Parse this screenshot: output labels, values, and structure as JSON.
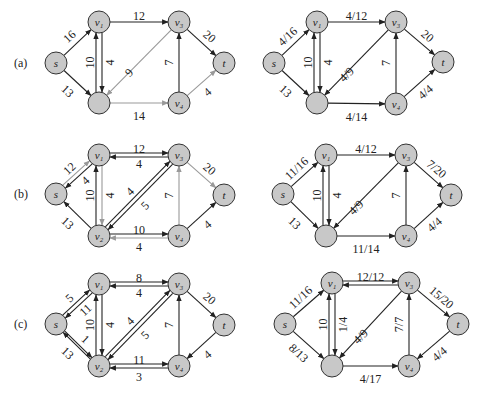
{
  "colors": {
    "node_fill": "#c8c8c8",
    "node_stroke": "#333333",
    "edge_dark": "#222222",
    "edge_gray": "#999999"
  },
  "node_radius": 11,
  "panels": [
    {
      "id": "a-left",
      "row_label": "(a)",
      "row_label_pos": [
        14,
        67
      ],
      "nodes": {
        "s": [
          56,
          63
        ],
        "v1": [
          99,
          22
        ],
        "v2": [
          99,
          103
        ],
        "v3": [
          179,
          22
        ],
        "v4": [
          179,
          103
        ],
        "t": [
          224,
          63
        ]
      },
      "node_labels": {
        "s": "s",
        "v1": "v₁",
        "v2": "",
        "v3": "v₃",
        "v4": "v₄",
        "t": "t"
      },
      "edges": [
        {
          "from": "s",
          "to": "v1",
          "label": "16",
          "color": "dark",
          "lx": -8,
          "ly": -6,
          "rot": -43
        },
        {
          "from": "s",
          "to": "v2",
          "label": "13",
          "color": "dark",
          "lx": -10,
          "ly": 8,
          "rot": 43
        },
        {
          "from": "v1",
          "to": "v2",
          "label": "10",
          "color": "dark",
          "off": -3,
          "lx": -9,
          "ly": 0,
          "rot": -90
        },
        {
          "from": "v2",
          "to": "v1",
          "label": "4",
          "color": "dark",
          "off": -3,
          "lx": 11,
          "ly": 0,
          "rot": -90
        },
        {
          "from": "v1",
          "to": "v3",
          "label": "12",
          "color": "dark",
          "lx": 0,
          "ly": -6,
          "rot": 0
        },
        {
          "from": "v3",
          "to": "v2",
          "label": "9",
          "color": "gray",
          "lx": -10,
          "ly": 10,
          "rot": -45
        },
        {
          "from": "v2",
          "to": "v4",
          "label": "14",
          "color": "gray",
          "lx": 0,
          "ly": 13,
          "rot": 0
        },
        {
          "from": "v4",
          "to": "v3",
          "label": "7",
          "color": "dark",
          "lx": -10,
          "ly": 0,
          "rot": -90
        },
        {
          "from": "v3",
          "to": "t",
          "label": "20",
          "color": "dark",
          "lx": 8,
          "ly": -6,
          "rot": 40
        },
        {
          "from": "v4",
          "to": "t",
          "label": "4",
          "color": "gray",
          "lx": 6,
          "ly": 9,
          "rot": -40
        }
      ]
    },
    {
      "id": "a-right",
      "row_label": "",
      "nodes": {
        "s": [
          274,
          63
        ],
        "v1": [
          317,
          22
        ],
        "v2": [
          317,
          103
        ],
        "v3": [
          396,
          22
        ],
        "v4": [
          396,
          104
        ],
        "t": [
          443,
          62
        ]
      },
      "node_labels": {
        "s": "s",
        "v1": "v₁",
        "v2": "",
        "v3": "v₃",
        "v4": "v₄",
        "t": "t"
      },
      "edges": [
        {
          "from": "s",
          "to": "v1",
          "label": "4/16",
          "color": "dark",
          "lx": -8,
          "ly": -6,
          "rot": -43
        },
        {
          "from": "s",
          "to": "v2",
          "label": "13",
          "color": "dark",
          "lx": -10,
          "ly": 8,
          "rot": 43
        },
        {
          "from": "v1",
          "to": "v2",
          "label": "10",
          "color": "dark",
          "off": -3,
          "lx": -9,
          "ly": 0,
          "rot": -90
        },
        {
          "from": "v2",
          "to": "v1",
          "label": "4",
          "color": "dark",
          "off": -3,
          "lx": 11,
          "ly": 0,
          "rot": -90
        },
        {
          "from": "v1",
          "to": "v3",
          "label": "4/12",
          "color": "dark",
          "lx": 0,
          "ly": -6,
          "rot": 0
        },
        {
          "from": "v3",
          "to": "v2",
          "label": "4/9",
          "color": "dark",
          "lx": -10,
          "ly": 12,
          "rot": -45
        },
        {
          "from": "v2",
          "to": "v4",
          "label": "4/14",
          "color": "dark",
          "lx": 0,
          "ly": 13,
          "rot": 0
        },
        {
          "from": "v4",
          "to": "v3",
          "label": "7",
          "color": "dark",
          "lx": -10,
          "ly": 0,
          "rot": -90
        },
        {
          "from": "v3",
          "to": "t",
          "label": "20",
          "color": "dark",
          "lx": 8,
          "ly": -6,
          "rot": 40
        },
        {
          "from": "v4",
          "to": "t",
          "label": "4/4",
          "color": "dark",
          "lx": 6,
          "ly": 9,
          "rot": -40
        }
      ]
    },
    {
      "id": "b-left",
      "row_label": "(b)",
      "row_label_pos": [
        14,
        198
      ],
      "nodes": {
        "s": [
          56,
          194
        ],
        "v1": [
          99,
          155
        ],
        "v2": [
          99,
          236
        ],
        "v3": [
          179,
          155
        ],
        "v4": [
          179,
          236
        ],
        "t": [
          224,
          195
        ]
      },
      "node_labels": {
        "s": "s",
        "v1": "v₁",
        "v2": "v₂",
        "v3": "v₃",
        "v4": "v₄",
        "t": "t"
      },
      "edges": [
        {
          "from": "s",
          "to": "v1",
          "label": "12",
          "color": "gray",
          "off": -2,
          "lx": -8,
          "ly": -6,
          "rot": -43
        },
        {
          "from": "v1",
          "to": "s",
          "label": "4",
          "color": "dark",
          "off": -2,
          "lx": 8,
          "ly": 6,
          "rot": -43
        },
        {
          "from": "v2",
          "to": "s",
          "label": "13",
          "color": "dark",
          "lx": -10,
          "ly": 8,
          "rot": 43
        },
        {
          "from": "v1",
          "to": "v2",
          "label": "10",
          "color": "gray",
          "off": -3,
          "lx": -9,
          "ly": 0,
          "rot": -90
        },
        {
          "from": "v2",
          "to": "v1",
          "label": "4",
          "color": "dark",
          "off": -3,
          "lx": 11,
          "ly": 0,
          "rot": -90
        },
        {
          "from": "v1",
          "to": "v3",
          "label": "12",
          "color": "dark",
          "off": -2,
          "lx": 0,
          "ly": -6,
          "rot": 0
        },
        {
          "from": "v3",
          "to": "v1",
          "label": "4",
          "color": "dark",
          "off": -2,
          "lx": 0,
          "ly": 9,
          "rot": 0
        },
        {
          "from": "v2",
          "to": "v3",
          "label": "4",
          "color": "dark",
          "off": -2,
          "lx": -9,
          "ly": -4,
          "rot": -45
        },
        {
          "from": "v3",
          "to": "v2",
          "label": "5",
          "color": "dark",
          "off": -2,
          "lx": 6,
          "ly": 10,
          "rot": -45
        },
        {
          "from": "v4",
          "to": "v2",
          "label": "10",
          "color": "gray",
          "off": -2,
          "lx": 0,
          "ly": -6,
          "rot": 0
        },
        {
          "from": "v2",
          "to": "v4",
          "label": "4",
          "color": "dark",
          "off": -2,
          "lx": 0,
          "ly": 11,
          "rot": 0
        },
        {
          "from": "v4",
          "to": "v3",
          "label": "7",
          "color": "gray",
          "lx": -10,
          "ly": 0,
          "rot": -90
        },
        {
          "from": "v3",
          "to": "t",
          "label": "20",
          "color": "gray",
          "lx": 8,
          "ly": -6,
          "rot": 40
        },
        {
          "from": "v4",
          "to": "t",
          "label": "4",
          "color": "dark",
          "lx": 6,
          "ly": 9,
          "rot": -40
        }
      ]
    },
    {
      "id": "b-right",
      "row_label": "",
      "nodes": {
        "s": [
          283,
          194
        ],
        "v1": [
          326,
          155
        ],
        "v2": [
          326,
          236
        ],
        "v3": [
          406,
          155
        ],
        "v4": [
          406,
          236
        ],
        "t": [
          451,
          195
        ]
      },
      "node_labels": {
        "s": "s",
        "v1": "v₁",
        "v2": "",
        "v3": "v₃",
        "v4": "v₄",
        "t": "t"
      },
      "edges": [
        {
          "from": "s",
          "to": "v1",
          "label": "11/16",
          "color": "dark",
          "lx": -8,
          "ly": -6,
          "rot": -43
        },
        {
          "from": "s",
          "to": "v2",
          "label": "13",
          "color": "dark",
          "lx": -10,
          "ly": 8,
          "rot": 43
        },
        {
          "from": "v1",
          "to": "v2",
          "label": "10",
          "color": "dark",
          "off": -3,
          "lx": -9,
          "ly": 0,
          "rot": -90
        },
        {
          "from": "v2",
          "to": "v1",
          "label": "4",
          "color": "dark",
          "off": -3,
          "lx": 11,
          "ly": 0,
          "rot": -90
        },
        {
          "from": "v1",
          "to": "v3",
          "label": "4/12",
          "color": "dark",
          "lx": 0,
          "ly": -6,
          "rot": 0
        },
        {
          "from": "v3",
          "to": "v2",
          "label": "4/9",
          "color": "dark",
          "lx": -10,
          "ly": 12,
          "rot": -45
        },
        {
          "from": "v2",
          "to": "v4",
          "label": "11/14",
          "color": "dark",
          "lx": 0,
          "ly": 13,
          "rot": 0
        },
        {
          "from": "v4",
          "to": "v3",
          "label": "7",
          "color": "dark",
          "lx": -10,
          "ly": 0,
          "rot": -90
        },
        {
          "from": "v3",
          "to": "t",
          "label": "7/20",
          "color": "dark",
          "lx": 8,
          "ly": -6,
          "rot": 40
        },
        {
          "from": "v4",
          "to": "t",
          "label": "4/4",
          "color": "dark",
          "lx": 6,
          "ly": 9,
          "rot": -40
        }
      ]
    },
    {
      "id": "c-left",
      "row_label": "(c)",
      "row_label_pos": [
        14,
        328
      ],
      "nodes": {
        "s": [
          56,
          324
        ],
        "v1": [
          99,
          284
        ],
        "v2": [
          99,
          366
        ],
        "v3": [
          179,
          284
        ],
        "v4": [
          179,
          366
        ],
        "t": [
          224,
          325
        ]
      },
      "node_labels": {
        "s": "s",
        "v1": "v₁",
        "v2": "v₂",
        "v3": "v₃",
        "v4": "v₄",
        "t": "t"
      },
      "edges": [
        {
          "from": "s",
          "to": "v1",
          "label": "5",
          "color": "dark",
          "off": -2,
          "lx": -8,
          "ly": -6,
          "rot": -43
        },
        {
          "from": "v1",
          "to": "s",
          "label": "11",
          "color": "dark",
          "off": -2,
          "lx": 8,
          "ly": 6,
          "rot": -43
        },
        {
          "from": "s",
          "to": "v2",
          "label": "13",
          "color": "dark",
          "off": -1,
          "lx": -10,
          "ly": 8,
          "rot": 43
        },
        {
          "from": "v2",
          "to": "s",
          "label": "1",
          "color": "dark",
          "off": -1,
          "lx": 8,
          "ly": -6,
          "rot": 43
        },
        {
          "from": "v1",
          "to": "v2",
          "label": "10",
          "color": "dark",
          "off": -3,
          "lx": -9,
          "ly": 0,
          "rot": -90
        },
        {
          "from": "v2",
          "to": "v1",
          "label": "4",
          "color": "dark",
          "off": -3,
          "lx": 11,
          "ly": 0,
          "rot": -90
        },
        {
          "from": "v1",
          "to": "v3",
          "label": "8",
          "color": "dark",
          "off": -2,
          "lx": 0,
          "ly": -6,
          "rot": 0
        },
        {
          "from": "v3",
          "to": "v1",
          "label": "4",
          "color": "dark",
          "off": -2,
          "lx": 0,
          "ly": 9,
          "rot": 0
        },
        {
          "from": "v2",
          "to": "v3",
          "label": "4",
          "color": "dark",
          "off": -2,
          "lx": -9,
          "ly": -4,
          "rot": -45
        },
        {
          "from": "v3",
          "to": "v2",
          "label": "5",
          "color": "dark",
          "off": -2,
          "lx": 6,
          "ly": 10,
          "rot": -45
        },
        {
          "from": "v4",
          "to": "v2",
          "label": "11",
          "color": "dark",
          "off": -2,
          "lx": 0,
          "ly": -6,
          "rot": 0
        },
        {
          "from": "v2",
          "to": "v4",
          "label": "3",
          "color": "dark",
          "off": -2,
          "lx": 0,
          "ly": 11,
          "rot": 0
        },
        {
          "from": "v4",
          "to": "v3",
          "label": "7",
          "color": "dark",
          "lx": -10,
          "ly": 0,
          "rot": -90
        },
        {
          "from": "v3",
          "to": "t",
          "label": "20",
          "color": "dark",
          "lx": 8,
          "ly": -6,
          "rot": 40
        },
        {
          "from": "t",
          "to": "v4",
          "label": "4",
          "color": "dark",
          "lx": 6,
          "ly": 9,
          "rot": -40
        }
      ]
    },
    {
      "id": "c-right",
      "row_label": "",
      "nodes": {
        "s": [
          285,
          324
        ],
        "v1": [
          332,
          283
        ],
        "v2": [
          332,
          366
        ],
        "v3": [
          409,
          283
        ],
        "v4": [
          409,
          366
        ],
        "t": [
          458,
          324
        ]
      },
      "node_labels": {
        "s": "s",
        "v1": "v₁",
        "v2": "",
        "v3": "v₃",
        "v4": "v₄",
        "t": "t"
      },
      "edges": [
        {
          "from": "s",
          "to": "v1",
          "label": "11/16",
          "color": "dark",
          "lx": -8,
          "ly": -6,
          "rot": -43
        },
        {
          "from": "s",
          "to": "v2",
          "label": "8/13",
          "color": "dark",
          "lx": -10,
          "ly": 8,
          "rot": 43
        },
        {
          "from": "v1",
          "to": "v2",
          "label": "10",
          "color": "dark",
          "off": -3,
          "lx": -9,
          "ly": 0,
          "rot": -90
        },
        {
          "from": "v2",
          "to": "v1",
          "label": "1/4",
          "color": "dark",
          "off": -3,
          "lx": 11,
          "ly": 0,
          "rot": -90
        },
        {
          "from": "v1",
          "to": "v3",
          "label": "12/12",
          "color": "dark",
          "off": -2,
          "lx": 0,
          "ly": -6,
          "rot": 0
        },
        {
          "from": "v3",
          "to": "v1",
          "label": "",
          "color": "dark",
          "off": -2,
          "lx": 0,
          "ly": 9,
          "rot": 0
        },
        {
          "from": "v3",
          "to": "v2",
          "label": "4/9",
          "color": "dark",
          "lx": -10,
          "ly": 12,
          "rot": -45
        },
        {
          "from": "v2",
          "to": "v4",
          "label": "4/17",
          "color": "dark",
          "lx": 0,
          "ly": 13,
          "rot": 0
        },
        {
          "from": "v4",
          "to": "v3",
          "label": "7/7",
          "color": "dark",
          "lx": -10,
          "ly": 0,
          "rot": -90
        },
        {
          "from": "v3",
          "to": "t",
          "label": "15/20",
          "color": "dark",
          "lx": 8,
          "ly": -6,
          "rot": 40
        },
        {
          "from": "t",
          "to": "v4",
          "label": "4/4",
          "color": "dark",
          "lx": 6,
          "ly": 9,
          "rot": -40
        }
      ]
    }
  ]
}
